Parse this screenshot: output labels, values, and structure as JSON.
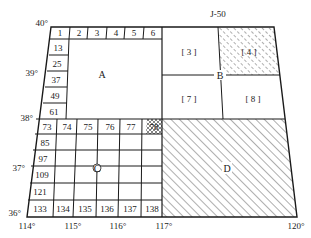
{
  "title": "J-50",
  "latitude_labels": [
    {
      "text": "40°",
      "x": 38,
      "y": 26
    },
    {
      "text": "39°",
      "x": 26,
      "y": 73
    },
    {
      "text": "38°",
      "x": 18,
      "y": 121
    },
    {
      "text": "37°",
      "x": 12,
      "y": 170
    },
    {
      "text": "36°",
      "x": 8,
      "y": 216
    }
  ],
  "longitude_labels": [
    {
      "text": "114°",
      "x": 27,
      "y": 229
    },
    {
      "text": "115°",
      "x": 71,
      "y": 229
    },
    {
      "text": "116°",
      "x": 117,
      "y": 229
    },
    {
      "text": "117°",
      "x": 164,
      "y": 229
    },
    {
      "text": "120°",
      "x": 297,
      "y": 229
    }
  ],
  "top_row_cells": [
    "1",
    "2",
    "3",
    "4",
    "5",
    "6"
  ],
  "left_column_cells": [
    "13",
    "25",
    "37",
    "49",
    "61"
  ],
  "c_grid": {
    "top_row": [
      "73",
      "74",
      "75",
      "76",
      "77",
      "78"
    ],
    "left_column": [
      "85",
      "97",
      "109",
      "121"
    ],
    "bottom_row": [
      "133",
      "134",
      "135",
      "136",
      "137",
      "138"
    ]
  },
  "region_labels": {
    "A": "A",
    "B": "B",
    "C": "C",
    "D": "D"
  },
  "quadrant_labels": {
    "q3": "[ 3 ]",
    "q4": "[ 4 ]",
    "q7": "[ 7 ]",
    "q8": "[ 8 ]"
  },
  "colors": {
    "line": "#1a1a1a",
    "hatch": "#333333",
    "background": "#ffffff"
  }
}
